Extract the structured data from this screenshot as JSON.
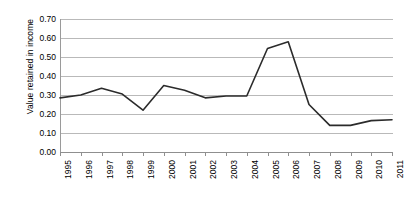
{
  "chart_data": {
    "type": "line",
    "title": "",
    "xlabel": "",
    "ylabel": "Value retained in income",
    "ylim": [
      0.0,
      0.7
    ],
    "ytick_values": [
      0.7,
      0.6,
      0.5,
      0.4,
      0.3,
      0.2,
      0.1,
      0.0
    ],
    "ytick_labels": [
      "0.70",
      "0.60",
      "0.50",
      "0.40",
      "0.30",
      "0.20",
      "0.10",
      "0.00"
    ],
    "grid": true,
    "legend": "none",
    "categories": [
      "1995",
      "1996",
      "1997",
      "1998",
      "1999",
      "2000",
      "2001",
      "2002",
      "2003",
      "2004",
      "2005",
      "2006",
      "2007",
      "2008",
      "2009",
      "2010",
      "2011"
    ],
    "series": [
      {
        "name": "Value retained in income",
        "values": [
          0.285,
          0.3,
          0.335,
          0.305,
          0.22,
          0.35,
          0.325,
          0.285,
          0.295,
          0.295,
          0.545,
          0.58,
          0.25,
          0.14,
          0.14,
          0.165,
          0.17
        ]
      }
    ]
  },
  "axis": {
    "y_title": "Value retained in income"
  }
}
